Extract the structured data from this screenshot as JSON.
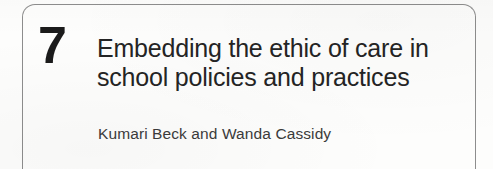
{
  "document": {
    "kind": "book-chapter-opening-page",
    "background_color": "#fdfdfc"
  },
  "frame": {
    "name": "rounded-rectangle-border",
    "color": "#8d8d8d"
  },
  "chapter": {
    "number": "7",
    "number_color": "#1b1b1b",
    "title_lines": [
      "Embedding the ethic of care in",
      "school policies and practices"
    ],
    "title_full": "Embedding the ethic of care in school policies and practices",
    "title_color": "#242424",
    "authors": "Kumari Beck and Wanda Cassidy",
    "authors_color": "#3b3b3b"
  }
}
